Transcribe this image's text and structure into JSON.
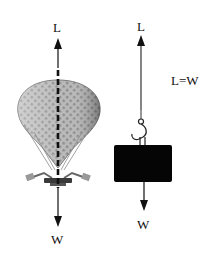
{
  "figure": {
    "left_panel": {
      "subject": "hot-air-balloon",
      "up_force_label": "L",
      "down_force_label": "W"
    },
    "right_panel": {
      "subject": "hanging-weight",
      "up_force_label": "L",
      "down_force_label": "W",
      "equation": "L=W"
    }
  },
  "colors": {
    "ink": "#111111",
    "balloon_gray": "#9a9a9a",
    "balloon_dark": "#555555",
    "weight_block": "#050505"
  }
}
